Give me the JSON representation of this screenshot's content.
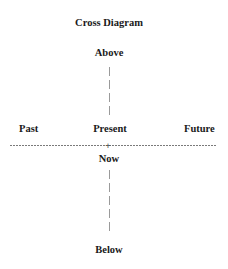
{
  "diagram": {
    "title": "Cross Diagram",
    "top_label": "Above",
    "bottom_label": "Below",
    "left_label": "Past",
    "center_label": "Present",
    "right_label": "Future",
    "below_center_label": "Now",
    "center_marker": "+"
  },
  "colors": {
    "text": "#1a1a1a",
    "vertical_line": "#9a9a9a",
    "horizontal_line": "#7a7a7a",
    "background": "#ffffff"
  }
}
